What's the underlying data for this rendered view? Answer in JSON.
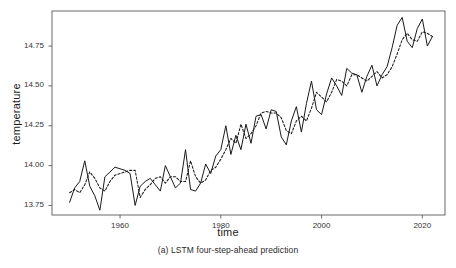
{
  "chart_data": {
    "type": "line",
    "title": "",
    "caption": "(a) LSTM four-step-ahead prediction",
    "xlabel": "time",
    "ylabel": "temperature",
    "xlim": [
      1946.5,
      2024.5
    ],
    "ylim": [
      13.69,
      14.97
    ],
    "xticks": [
      1960,
      1980,
      2000,
      2020
    ],
    "xtick_labels": [
      "1960",
      "1980",
      "2000",
      "2020"
    ],
    "yticks": [
      13.75,
      14.0,
      14.25,
      14.5,
      14.75
    ],
    "ytick_labels": [
      "13.75",
      "14.00",
      "14.25",
      "14.50",
      "14.75"
    ],
    "grid": false,
    "legend": null,
    "frame_color": "#595959",
    "series": [
      {
        "name": "observed",
        "style": "solid",
        "color": "#1a1a1a",
        "x": [
          1950,
          1951,
          1952,
          1953,
          1954,
          1955,
          1956,
          1957,
          1958,
          1959,
          1960,
          1961,
          1962,
          1963,
          1964,
          1965,
          1966,
          1967,
          1968,
          1969,
          1970,
          1971,
          1972,
          1973,
          1974,
          1975,
          1976,
          1977,
          1978,
          1979,
          1980,
          1981,
          1982,
          1983,
          1984,
          1985,
          1986,
          1987,
          1988,
          1989,
          1990,
          1991,
          1992,
          1993,
          1994,
          1995,
          1996,
          1997,
          1998,
          1999,
          2000,
          2001,
          2002,
          2003,
          2004,
          2005,
          2006,
          2007,
          2008,
          2009,
          2010,
          2011,
          2012,
          2013,
          2014,
          2015,
          2016,
          2017,
          2018,
          2019,
          2020,
          2021,
          2022
        ],
        "y": [
          13.77,
          13.86,
          13.9,
          14.03,
          13.87,
          13.81,
          13.72,
          13.93,
          13.96,
          13.99,
          13.98,
          13.97,
          13.95,
          13.75,
          13.87,
          13.9,
          13.92,
          13.88,
          13.84,
          14.0,
          13.93,
          13.86,
          13.89,
          14.1,
          13.85,
          13.84,
          13.89,
          14.01,
          13.95,
          14.06,
          14.1,
          14.25,
          14.07,
          14.19,
          14.1,
          14.26,
          14.14,
          14.31,
          14.32,
          14.23,
          14.35,
          14.34,
          14.18,
          14.13,
          14.28,
          14.37,
          14.21,
          14.39,
          14.53,
          14.35,
          14.32,
          14.45,
          14.55,
          14.5,
          14.44,
          14.61,
          14.58,
          14.57,
          14.46,
          14.56,
          14.63,
          14.5,
          14.57,
          14.62,
          14.74,
          14.88,
          14.93,
          14.78,
          14.74,
          14.86,
          14.92,
          14.75,
          14.81
        ]
      },
      {
        "name": "predicted",
        "style": "dashed",
        "color": "#1a1a1a",
        "x": [
          1950,
          1951,
          1952,
          1953,
          1954,
          1955,
          1956,
          1957,
          1958,
          1959,
          1960,
          1961,
          1962,
          1963,
          1964,
          1965,
          1966,
          1967,
          1968,
          1969,
          1970,
          1971,
          1972,
          1973,
          1974,
          1975,
          1976,
          1977,
          1978,
          1979,
          1980,
          1981,
          1982,
          1983,
          1984,
          1985,
          1986,
          1987,
          1988,
          1989,
          1990,
          1991,
          1992,
          1993,
          1994,
          1995,
          1996,
          1997,
          1998,
          1999,
          2000,
          2001,
          2002,
          2003,
          2004,
          2005,
          2006,
          2007,
          2008,
          2009,
          2010,
          2011,
          2012,
          2013,
          2014,
          2015,
          2016,
          2017,
          2018,
          2019,
          2020,
          2021,
          2022
        ],
        "y": [
          13.83,
          13.85,
          13.83,
          13.88,
          13.96,
          13.92,
          13.86,
          13.84,
          13.9,
          13.94,
          13.95,
          13.96,
          13.97,
          13.97,
          13.8,
          13.85,
          13.88,
          13.92,
          13.93,
          13.89,
          13.93,
          13.93,
          13.9,
          13.9,
          14.03,
          13.93,
          13.89,
          13.91,
          13.97,
          13.99,
          14.04,
          14.1,
          14.17,
          14.14,
          14.26,
          14.17,
          14.2,
          14.25,
          14.33,
          14.34,
          14.33,
          14.33,
          14.3,
          14.22,
          14.2,
          14.28,
          14.31,
          14.28,
          14.36,
          14.46,
          14.43,
          14.4,
          14.46,
          14.54,
          14.53,
          14.5,
          14.57,
          14.57,
          14.55,
          14.53,
          14.56,
          14.59,
          14.55,
          14.57,
          14.62,
          14.7,
          14.79,
          14.83,
          14.79,
          14.78,
          14.84,
          14.83,
          14.81
        ]
      }
    ]
  },
  "plot": {
    "left": 52,
    "top": 11,
    "right": 445,
    "bottom": 215
  }
}
